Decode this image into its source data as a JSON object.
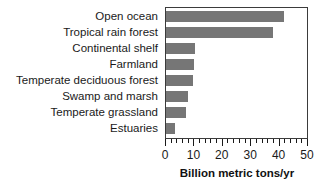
{
  "chart_data": {
    "type": "bar",
    "orientation": "horizontal",
    "title": "",
    "subtitle": "",
    "xlabel": "Billion metric tons/yr",
    "ylabel": "",
    "categories": [
      "Open ocean",
      "Tropical rain forest",
      "Continental shelf",
      "Farmland",
      "Temperate deciduous forest",
      "Swamp and marsh",
      "Temperate grassland",
      "Estuaries"
    ],
    "values": [
      41.5,
      37.5,
      10.3,
      10.0,
      9.6,
      7.6,
      6.9,
      3.1
    ],
    "xlim": [
      0,
      50
    ],
    "xticks": [
      0,
      10,
      20,
      30,
      40,
      50
    ],
    "xtick_labels": [
      "0",
      "10",
      "20",
      "30",
      "40",
      "50"
    ],
    "minor_tick_interval": 2,
    "grid": false,
    "legend": false,
    "bar_color": "#767676",
    "axis_color": "#3b3b3b",
    "text_color": "#1a1a1a",
    "background": "#ffffff"
  }
}
